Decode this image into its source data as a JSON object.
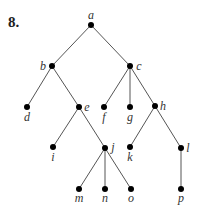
{
  "problem_number": "8.",
  "tree": {
    "nodes": [
      {
        "id": "a",
        "label": "a",
        "x": 91,
        "y": 25,
        "lx": 91,
        "ly": 19,
        "anchor": "middle"
      },
      {
        "id": "b",
        "label": "b",
        "x": 52,
        "y": 66,
        "lx": 43,
        "ly": 70,
        "anchor": "middle"
      },
      {
        "id": "c",
        "label": "c",
        "x": 130,
        "y": 66,
        "lx": 139,
        "ly": 70,
        "anchor": "middle"
      },
      {
        "id": "d",
        "label": "d",
        "x": 27,
        "y": 107,
        "lx": 27,
        "ly": 121,
        "anchor": "middle"
      },
      {
        "id": "e",
        "label": "e",
        "x": 79,
        "y": 107,
        "lx": 87,
        "ly": 111,
        "anchor": "middle"
      },
      {
        "id": "f",
        "label": "f",
        "x": 104,
        "y": 107,
        "lx": 104,
        "ly": 121,
        "anchor": "middle"
      },
      {
        "id": "g",
        "label": "g",
        "x": 130,
        "y": 107,
        "lx": 130,
        "ly": 121,
        "anchor": "middle"
      },
      {
        "id": "h",
        "label": "h",
        "x": 155,
        "y": 106,
        "lx": 163,
        "ly": 110,
        "anchor": "middle"
      },
      {
        "id": "i",
        "label": "i",
        "x": 53,
        "y": 147,
        "lx": 53,
        "ly": 161,
        "anchor": "middle"
      },
      {
        "id": "j",
        "label": "j",
        "x": 105,
        "y": 148,
        "lx": 113,
        "ly": 151,
        "anchor": "middle"
      },
      {
        "id": "k",
        "label": "k",
        "x": 130,
        "y": 147,
        "lx": 130,
        "ly": 161,
        "anchor": "middle"
      },
      {
        "id": "l",
        "label": "l",
        "x": 181,
        "y": 148,
        "lx": 188,
        "ly": 152,
        "anchor": "middle"
      },
      {
        "id": "m",
        "label": "m",
        "x": 79,
        "y": 189,
        "lx": 79,
        "ly": 202,
        "anchor": "middle"
      },
      {
        "id": "n",
        "label": "n",
        "x": 105,
        "y": 189,
        "lx": 105,
        "ly": 202,
        "anchor": "middle"
      },
      {
        "id": "o",
        "label": "o",
        "x": 131,
        "y": 189,
        "lx": 131,
        "ly": 202,
        "anchor": "middle"
      },
      {
        "id": "p",
        "label": "p",
        "x": 181,
        "y": 189,
        "lx": 181,
        "ly": 202,
        "anchor": "middle"
      }
    ],
    "edges": [
      [
        "a",
        "b"
      ],
      [
        "a",
        "c"
      ],
      [
        "b",
        "d"
      ],
      [
        "b",
        "e"
      ],
      [
        "c",
        "f"
      ],
      [
        "c",
        "g"
      ],
      [
        "c",
        "h"
      ],
      [
        "e",
        "i"
      ],
      [
        "e",
        "j"
      ],
      [
        "h",
        "k"
      ],
      [
        "h",
        "l"
      ],
      [
        "j",
        "m"
      ],
      [
        "j",
        "n"
      ],
      [
        "j",
        "o"
      ],
      [
        "l",
        "p"
      ]
    ]
  }
}
